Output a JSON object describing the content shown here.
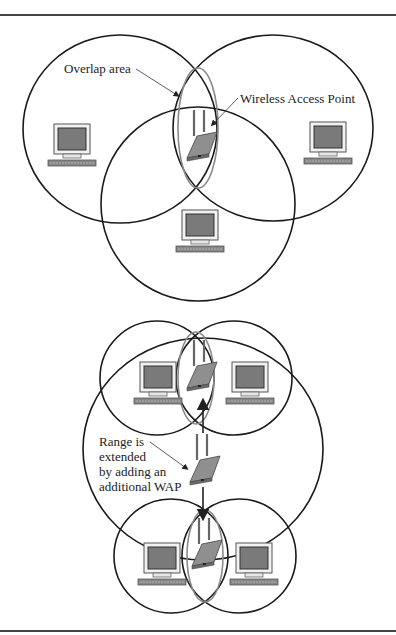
{
  "figure": {
    "top_diagram": {
      "labels": {
        "overlap": "Overlap area",
        "wap": "Wireless Access Point"
      },
      "coverage_cells": 3,
      "computers": 3,
      "access_points": 1
    },
    "bottom_diagram": {
      "labels": {
        "range_line1": "Range is",
        "range_line2": "extended",
        "range_line3": "by adding an",
        "range_line4": "additional WAP"
      },
      "coverage_cells": 5,
      "computers": 4,
      "access_points": 3
    },
    "colors": {
      "circle_stroke": "#1a1a1a",
      "overlap_stroke": "#8a8a8a",
      "screen_fill": "#7a7a7a",
      "device_fill": "#9a9a9a",
      "rule": "#444444"
    }
  }
}
